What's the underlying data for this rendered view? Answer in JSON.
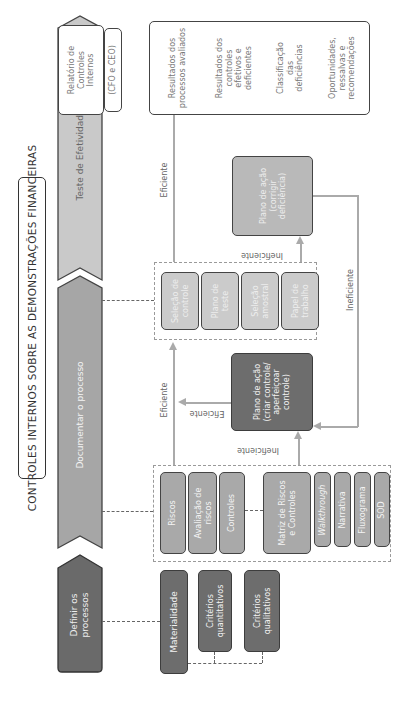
{
  "title": "CONTROLES INTERNOS SOBRE AS DEMONSTRAÇÕES FINANCEIRAS",
  "phases": [
    {
      "label": "Definir os processos"
    },
    {
      "label": "Documentar o processo"
    },
    {
      "label": "Teste de Efetividade"
    }
  ],
  "define": {
    "materiality": "Materialidade",
    "quantitative": "Critérios quantitativos",
    "qualitative": "Critérios qualitativos"
  },
  "document": {
    "risks": "Riscos",
    "risk_assessment": "Avaliação de riscos",
    "controls": "Controles",
    "matrix": "Matriz de Riscos e Controles",
    "walkthrough": "Walkthrough",
    "narrative": "Narrativa",
    "flowchart": "Fluxograma",
    "sod": "SOD"
  },
  "action_plan_create": "Plano de ação (criar controle/ aperfeiçoar controle)",
  "test": {
    "control_selection": "Seleção de controle",
    "test_plan": "Plano de teste",
    "sample_selection": "Seleção amostral",
    "workpaper": "Papel de trabalho"
  },
  "action_plan_fix": "Plano de ação (corrigir deficiência)",
  "report": {
    "title": "Relatório de Controles Internos",
    "signers": "(CFO e CEO)"
  },
  "outcomes": [
    "Resultados dos processos avaliados",
    "Resultados dos controles efetivos e deficientes",
    "Classificação das deficiências",
    "Oportunidades, ressalvas e recomendações"
  ],
  "flow_labels": {
    "efficient": "Eficiente",
    "inefficient": "Ineficiente"
  }
}
